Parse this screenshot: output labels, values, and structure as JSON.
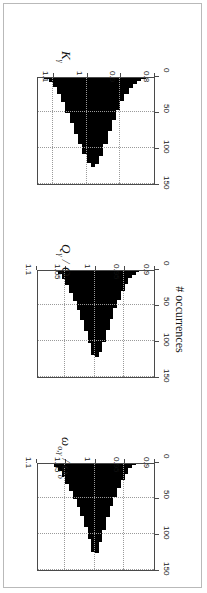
{
  "figure": {
    "shared_ylabel": "# occurrences",
    "rotation_degrees": 180,
    "panels": [
      {
        "id": "omega",
        "xlabel_main": "ω",
        "xlabel_sub": "o,γ",
        "xlabel_div": " / ",
        "xlabel_main2": "ω",
        "xlabel_sub2": "o",
        "xlabel_plain": "ωo,γ / ωo"
      },
      {
        "id": "q",
        "xlabel_main": "Q",
        "xlabel_sub": "γ",
        "xlabel_div": " / ",
        "xlabel_main2": "Q",
        "xlabel_sub2": "",
        "xlabel_plain": "Qγ / Q"
      },
      {
        "id": "k",
        "xlabel_main": "K",
        "xlabel_sub": "γ",
        "xlabel_div": "",
        "xlabel_main2": "",
        "xlabel_sub2": "",
        "xlabel_plain": "Kγ"
      }
    ]
  },
  "chart_data": [
    {
      "type": "bar",
      "id": "omega",
      "title": "",
      "xlabel": "ωo,γ / ωo",
      "ylabel": "# occurrences",
      "xlim": [
        0.9,
        1.1
      ],
      "ylim": [
        0,
        150
      ],
      "xticks": [
        0.9,
        0.95,
        1,
        1.05,
        1.1
      ],
      "xticklabels": [
        "0.9",
        "0.95",
        "1",
        "1.05",
        "1.1"
      ],
      "yticks": [
        0,
        50,
        100,
        150
      ],
      "yticklabels": [
        "0",
        "50",
        "100",
        "150"
      ],
      "grid": true,
      "legend": "none",
      "bin_width": 0.00625,
      "bin_centers": [
        0.9344,
        0.9406,
        0.9469,
        0.9531,
        0.9594,
        0.9656,
        0.9719,
        0.9781,
        0.9844,
        0.9906,
        0.9969,
        1.0031,
        1.0094,
        1.0156,
        1.0219,
        1.0281,
        1.0344,
        1.0406,
        1.0469,
        1.0531,
        1.0594,
        1.0656
      ],
      "values": [
        2,
        6,
        14,
        22,
        34,
        46,
        58,
        74,
        92,
        108,
        124,
        122,
        104,
        88,
        72,
        60,
        48,
        38,
        28,
        18,
        10,
        4
      ]
    },
    {
      "type": "bar",
      "id": "q",
      "title": "",
      "xlabel": "Qγ / Q",
      "ylabel": "# occurrences",
      "xlim": [
        0.9,
        1.1
      ],
      "ylim": [
        0,
        150
      ],
      "xticks": [
        0.9,
        0.95,
        1,
        1.05,
        1.1
      ],
      "xticklabels": [
        "0.9",
        "0.95",
        "1",
        "1.05",
        "1.1"
      ],
      "yticks": [
        0,
        50,
        100,
        150
      ],
      "yticklabels": [
        "0",
        "50",
        "100",
        "150"
      ],
      "grid": true,
      "legend": "none",
      "bin_width": 0.00625,
      "bin_centers": [
        0.9281,
        0.9344,
        0.9406,
        0.9469,
        0.9531,
        0.9594,
        0.9656,
        0.9719,
        0.9781,
        0.9844,
        0.9906,
        0.9969,
        1.0031,
        1.0094,
        1.0156,
        1.0219,
        1.0281,
        1.0344,
        1.0406,
        1.0469,
        1.0531,
        1.0594
      ],
      "values": [
        2,
        5,
        10,
        18,
        28,
        40,
        52,
        66,
        82,
        98,
        112,
        120,
        116,
        100,
        84,
        68,
        54,
        42,
        30,
        20,
        11,
        4
      ]
    },
    {
      "type": "bar",
      "id": "k",
      "title": "",
      "xlabel": "Kγ",
      "ylabel": "# occurrences",
      "xlim": [
        0.8,
        1.15
      ],
      "ylim": [
        0,
        150
      ],
      "xticks": [
        0.8,
        0.9,
        1,
        1.1
      ],
      "xticklabels": [
        "0.8",
        "0.9",
        "1",
        "1.1"
      ],
      "yticks": [
        0,
        50,
        100,
        150
      ],
      "yticklabels": [
        "0",
        "50",
        "100",
        "150"
      ],
      "grid": true,
      "legend": "none",
      "bin_width": 0.0125,
      "bin_centers": [
        0.8313,
        0.8438,
        0.8563,
        0.8688,
        0.8813,
        0.8938,
        0.9063,
        0.9188,
        0.9313,
        0.9438,
        0.9563,
        0.9688,
        0.9813,
        0.9938,
        1.0063,
        1.0188,
        1.0313,
        1.0438,
        1.0563,
        1.0688,
        1.0813,
        1.0938,
        1.1063,
        1.1188
      ],
      "values": [
        2,
        4,
        8,
        14,
        22,
        32,
        44,
        58,
        74,
        92,
        108,
        120,
        124,
        118,
        106,
        92,
        78,
        62,
        48,
        34,
        22,
        12,
        6,
        2
      ]
    }
  ]
}
